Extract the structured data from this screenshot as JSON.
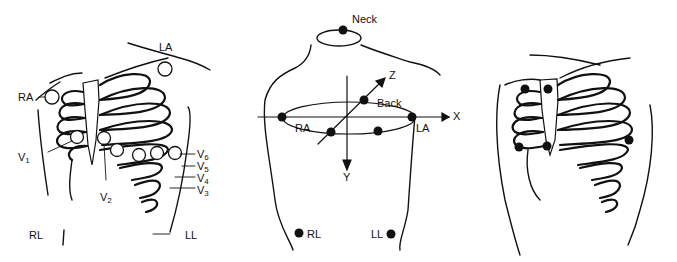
{
  "panels": {
    "standard_12_lead": {
      "labels": {
        "ra": "RA",
        "la": "LA",
        "rl": "RL",
        "ll": "LL",
        "v1": "V",
        "v1_sub": "1",
        "v2": "V",
        "v2_sub": "2",
        "v3": "V",
        "v3_sub": "3",
        "v4": "V",
        "v4_sub": "4",
        "v5": "V",
        "v5_sub": "5",
        "v6": "V",
        "v6_sub": "6"
      }
    },
    "frank_xyz_lead": {
      "labels": {
        "neck": "Neck",
        "back": "Back",
        "ra": "RA",
        "la": "LA",
        "rl": "RL",
        "ll": "LL",
        "x": "X",
        "y": "Y",
        "z": "Z"
      }
    },
    "eassi_lead": {
      "labels": {}
    }
  },
  "colors": {
    "ink": "#111111",
    "background": "#ffffff"
  }
}
